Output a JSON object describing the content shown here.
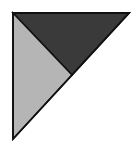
{
  "diagram": {
    "type": "geometric-triangle-partition",
    "outer_triangle": {
      "vertices": [
        [
          13,
          13
        ],
        [
          129,
          13
        ],
        [
          13,
          139
        ]
      ]
    },
    "regions": [
      {
        "name": "dark-triangle",
        "color": "#3a3a3a",
        "vertices": [
          [
            13,
            13
          ],
          [
            129,
            13
          ],
          [
            72,
            75
          ]
        ]
      },
      {
        "name": "light-triangle",
        "color": "#b5b5b5",
        "vertices": [
          [
            13,
            13
          ],
          [
            72,
            75
          ],
          [
            13,
            139
          ]
        ]
      }
    ],
    "stroke_color": "#111111"
  }
}
